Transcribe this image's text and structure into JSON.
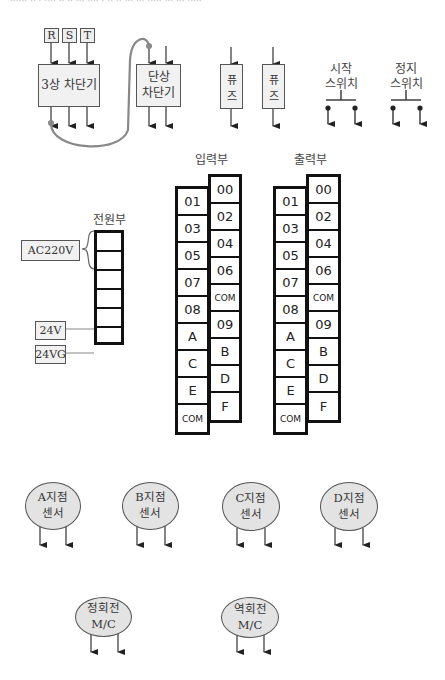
{
  "header": {
    "cutoff_text": "······ ·· · ···· ·· ·· ··· ···· · ·· ·· ··· ··· ····· ··· ··· ·····"
  },
  "breakers": {
    "phases": [
      "R",
      "S",
      "T"
    ],
    "three_phase_label": "3상 차단기",
    "single_phase_label_line1": "단상",
    "single_phase_label_line2": "차단기"
  },
  "fuses": [
    {
      "line1": "퓨",
      "line2": "즈"
    },
    {
      "line1": "퓨",
      "line2": "즈"
    }
  ],
  "switches": {
    "start": {
      "line1": "시작",
      "line2": "스위치"
    },
    "stop": {
      "line1": "정지",
      "line2": "스위치"
    }
  },
  "power_unit": {
    "title": "전원부",
    "labels": {
      "ac": "AC220V",
      "v24": "24V",
      "v24g": "24VG"
    },
    "cell_count": 6
  },
  "input_unit": {
    "title": "입력부",
    "left_column": [
      "01",
      "03",
      "05",
      "07",
      "08",
      "A",
      "C",
      "E",
      "COM"
    ],
    "right_column": [
      "00",
      "02",
      "04",
      "06",
      "COM",
      "09",
      "B",
      "D",
      "F"
    ]
  },
  "output_unit": {
    "title": "출력부",
    "left_column": [
      "01",
      "03",
      "05",
      "07",
      "08",
      "A",
      "C",
      "E",
      "COM"
    ],
    "right_column": [
      "00",
      "02",
      "04",
      "06",
      "COM",
      "09",
      "B",
      "D",
      "F"
    ]
  },
  "sensors": [
    {
      "line1": "A지점",
      "line2": "센서"
    },
    {
      "line1": "B지점",
      "line2": "센서"
    },
    {
      "line1": "C지점",
      "line2": "센서"
    },
    {
      "line1": "D지점",
      "line2": "센서"
    }
  ],
  "contactors": [
    {
      "line1": "정회전",
      "line2": "M/C"
    },
    {
      "line1": "역회전",
      "line2": "M/C"
    }
  ],
  "colors": {
    "terminal_border": "#111111",
    "box_fill": "#f1f1f1",
    "ellipse_fill": "#e3e3e3",
    "wire": "#888888"
  }
}
